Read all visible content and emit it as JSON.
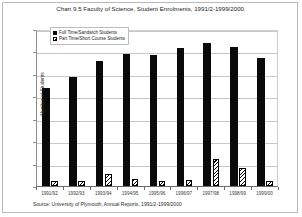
{
  "chart_data": {
    "type": "bar",
    "title": "Chart 9.5 Faculty of Science, Student Enrolments, 1991/2-1999/2000.",
    "xlabel": "",
    "ylabel": "Number of Students",
    "ylim": [
      0,
      3500
    ],
    "ytick_step": 500,
    "yticks": [
      3500,
      3000,
      2500,
      2000,
      1500,
      1000,
      500,
      0
    ],
    "ytick_labels": [
      "3500",
      "3000",
      "2500",
      "2000",
      "1500",
      "1000",
      "500",
      "0"
    ],
    "grid": true,
    "legend_position": "top-left-inside",
    "categories": [
      "1991/92",
      "1992/93",
      "1993/94",
      "1994/95",
      "1995/96",
      "1996/97",
      "1997/98",
      "1998/99",
      "1999/00"
    ],
    "series": [
      {
        "name": "Full Time/Sandwich Students",
        "fill": "solid-black",
        "color": "#0a0a0a",
        "values": [
          2180,
          2430,
          2790,
          2950,
          2930,
          3080,
          3190,
          3110,
          2850
        ]
      },
      {
        "name": "Part Time/Short Course Students",
        "fill": "diagonal-hatch",
        "color": "#000000",
        "values": [
          110,
          110,
          270,
          150,
          110,
          130,
          600,
          400,
          110
        ]
      }
    ],
    "source": "Source: University of Plymouth, Annual Reports, 1991/2-1999/2000"
  },
  "figure": {
    "background": "#ffffff",
    "frame_color": "#b9b9b9",
    "gridline_color": "#c8c8c8",
    "axis_color": "#6b6b6b"
  }
}
